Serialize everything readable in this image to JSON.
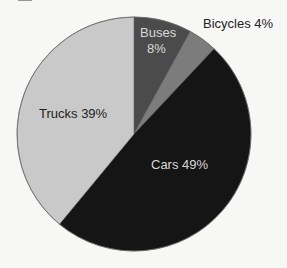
{
  "chart_data": {
    "type": "pie",
    "title": "",
    "start_angle_deg": 90,
    "direction": "clockwise",
    "slices": [
      {
        "label": "Buses",
        "value": 8,
        "display": "8%",
        "color": "#4b4b4b",
        "text_color": "#d8d8d8"
      },
      {
        "label": "Bicycles",
        "value": 4,
        "display": "4%",
        "color": "#7c7c7c",
        "text_color": "#222222"
      },
      {
        "label": "Cars",
        "value": 49,
        "display": "49%",
        "color": "#151515",
        "text_color": "#d8d8d8"
      },
      {
        "label": "Trucks",
        "value": 39,
        "display": "39%",
        "color": "#c9c9c9",
        "text_color": "#222222"
      }
    ],
    "legend": "none",
    "units": "%"
  },
  "labels": {
    "buses_name": "Buses",
    "buses_pct": "8%",
    "bicycles": "Bicycles 4%",
    "cars": "Cars 49%",
    "trucks": "Trucks 39%"
  },
  "geometry": {
    "cx": 134,
    "cy": 134,
    "r": 117
  }
}
